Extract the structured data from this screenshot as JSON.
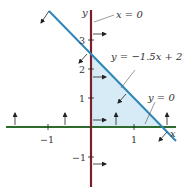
{
  "figure": {
    "axes": {
      "x_label": "x",
      "y_label": "y",
      "x_ticks": [
        {
          "value": -1,
          "label": "−1"
        },
        {
          "value": 1,
          "label": "1"
        }
      ],
      "y_ticks": [
        {
          "value": 3,
          "label": "3"
        },
        {
          "value": 2,
          "label": "2"
        },
        {
          "value": 1,
          "label": "1"
        },
        {
          "value": -1,
          "label": "−1"
        }
      ]
    },
    "lines": [
      {
        "label": "x = 0",
        "color": "#7a1f2b"
      },
      {
        "label": "y = −1.5x + 2.5",
        "color": "#2f86b8"
      },
      {
        "label": "y = 0",
        "color": "#2e6b2e"
      }
    ],
    "region_fill": "#d6ebf5",
    "colors": {
      "y_axis_line": "#7a1f2b",
      "x_axis_line": "#2e6b2e",
      "slant_line": "#2f86b8",
      "arrows": "#222222"
    }
  }
}
